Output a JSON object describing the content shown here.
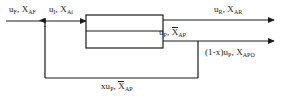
{
  "diagram": {
    "type": "process-flow-block-diagram",
    "title": "",
    "background_color": "#ffffff",
    "line_color": "#1b1b1b",
    "text_color": "#1b1b1b",
    "unit_block": {
      "name": "reactor-separator-block",
      "label": "",
      "x": 86,
      "y": 15,
      "width": 77,
      "height": 33,
      "divider_y": 31
    },
    "streams": [
      {
        "id": "feed",
        "name": "feed-stream",
        "flow_symbol": "u",
        "flow_subscript": "F",
        "comp_symbol": "X",
        "comp_subscript": "AF",
        "overbar": false,
        "label_plain": "u_F, X_AF",
        "direction": "right"
      },
      {
        "id": "inlet",
        "name": "mixed-inlet-stream",
        "flow_symbol": "u",
        "flow_subscript": "I",
        "comp_symbol": "X",
        "comp_subscript": "Ai",
        "overbar": false,
        "label_plain": "u_I, X_Ai",
        "direction": "right"
      },
      {
        "id": "recycle_out",
        "name": "overhead-outlet-stream",
        "flow_symbol": "u",
        "flow_subscript": "R",
        "comp_symbol": "X",
        "comp_subscript": "AR",
        "overbar": false,
        "label_plain": "u_R, X_AR",
        "direction": "right"
      },
      {
        "id": "purge",
        "name": "bottoms-stream",
        "flow_symbol": "u",
        "flow_subscript": "P",
        "comp_symbol": "X",
        "comp_subscript": "AP",
        "overbar": true,
        "label_plain": "u_P, X_AP",
        "direction": "right"
      },
      {
        "id": "product",
        "name": "product-outlet-stream",
        "prefix": "(1-x)",
        "flow_symbol": "u",
        "flow_subscript": "P",
        "comp_symbol": "X",
        "comp_subscript": "APO",
        "overbar": false,
        "label_plain": "(1-x)u_P, X_APO",
        "direction": "right"
      },
      {
        "id": "feedback",
        "name": "recycle-feedback-stream",
        "prefix": "x",
        "flow_symbol": "u",
        "flow_subscript": "P",
        "comp_symbol": "X",
        "comp_subscript": "AP",
        "overbar": true,
        "label_plain": "xu_P, X_AP",
        "direction": "left-then-up"
      }
    ],
    "labels": {
      "feed": {
        "pre": "",
        "u": "u",
        "u_sub": "F",
        "sep": ", ",
        "x": "X",
        "x_sub": "AF"
      },
      "inlet": {
        "pre": "",
        "u": "u",
        "u_sub": "I",
        "sep": ", ",
        "x": "X",
        "x_sub": "Ai"
      },
      "recycle": {
        "pre": "",
        "u": "u",
        "u_sub": "R",
        "sep": ", ",
        "x": "X",
        "x_sub": "AR"
      },
      "purge": {
        "pre": "",
        "u": "u",
        "u_sub": "P",
        "sep": ", ",
        "x": "X",
        "x_sub": "AP"
      },
      "product": {
        "pre": "(1-x)",
        "u": "u",
        "u_sub": "P",
        "sep": ", ",
        "x": "X",
        "x_sub": "APO"
      },
      "feedback": {
        "pre": "x",
        "u": "u",
        "u_sub": "P",
        "sep": ", ",
        "x": "X",
        "x_sub": "AP"
      }
    },
    "junction": {
      "name": "mixing-junction",
      "x": 45,
      "y": 21,
      "arrow": "up"
    }
  }
}
